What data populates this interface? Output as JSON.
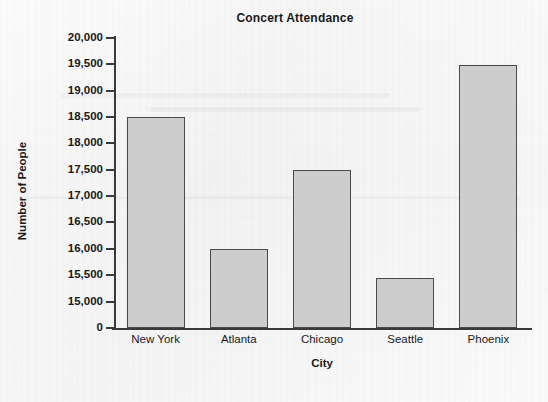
{
  "chart_data": {
    "type": "bar",
    "title": "Concert Attendance",
    "xlabel": "City",
    "ylabel": "Number of People",
    "categories": [
      "New York",
      "Atlanta",
      "Chicago",
      "Seattle",
      "Phoenix"
    ],
    "values": [
      18500,
      16000,
      17500,
      15450,
      19480
    ],
    "ytick_labels": [
      "20,000",
      "19,500",
      "19,000",
      "18,500",
      "18,000",
      "17,500",
      "17,000",
      "16,500",
      "16,000",
      "15,500",
      "15,000",
      "0"
    ],
    "ytick_values": [
      20000,
      19500,
      19000,
      18500,
      18000,
      17500,
      17000,
      16500,
      16000,
      15500,
      15000,
      0
    ],
    "ylim": [
      15000,
      20000
    ],
    "axis_break": true,
    "grid": false,
    "legend": null,
    "bar_fill_color": "#cdcdcd",
    "bar_edge_color": "#4a4a4a",
    "axis_color": "#3a3a3a",
    "background_color": "#f2f2f2"
  }
}
